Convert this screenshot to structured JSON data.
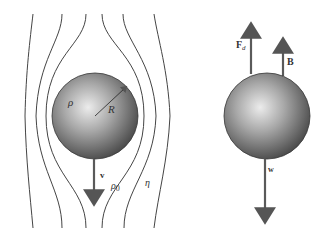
{
  "left_panel": {
    "title": "Sphere falling through viscous fluid",
    "labels": {
      "sphere_density": "ρ",
      "radius": "R",
      "velocity": "v",
      "fluid_density_symbol": "ρ",
      "fluid_density_subscript": "0",
      "viscosity": "η"
    }
  },
  "right_panel": {
    "title": "Free-body diagram",
    "labels": {
      "drag_force_symbol": "F",
      "drag_force_subscript": "d",
      "buoyant_force": "B",
      "weight": "w"
    }
  },
  "colors": {
    "line": "#444444",
    "arrow": "#5a5a5a",
    "sphere_light": "#e6e6e6",
    "sphere_dark": "#4a4a4a"
  }
}
